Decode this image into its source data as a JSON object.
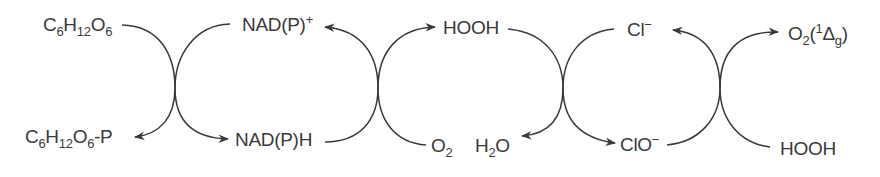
{
  "diagram": {
    "colors": {
      "stroke": "#3a3a3a",
      "text": "#3a3a3a",
      "background": "#ffffff"
    },
    "species": {
      "glucose": {
        "main": "C",
        "s1": "6",
        "m2": "H",
        "s2": "12",
        "m3": "O",
        "s3": "6"
      },
      "glucose_p": {
        "main": "C",
        "s1": "6",
        "m2": "H",
        "s2": "12",
        "m3": "O",
        "s3": "6",
        "tail": "-P"
      },
      "nadp_plus": {
        "main": "NAD(P)",
        "sup": "+"
      },
      "nadph": {
        "main": "NAD(P)H"
      },
      "hooh_top": {
        "main": "HOOH"
      },
      "o2": {
        "main": "O",
        "sub": "2"
      },
      "h2o": {
        "main": "H",
        "sub": "2",
        "tail": "O"
      },
      "cl_minus": {
        "main": "Cl",
        "sup": "−"
      },
      "clo_minus": {
        "main": "ClO",
        "sup": "−"
      },
      "singlet_o2": {
        "main": "O",
        "sub": "2",
        "open": "(",
        "sup": "1",
        "delta": "Δ",
        "dsub": "g",
        "close": ")"
      },
      "hooh_bottom": {
        "main": "HOOH"
      }
    },
    "reactions": [
      {
        "id": "r1",
        "from": "C6H12O6",
        "to": "C6H12O6-P"
      },
      {
        "id": "r1b",
        "from": "NAD(P)+",
        "to": "NAD(P)H"
      },
      {
        "id": "r2",
        "from": "NAD(P)H",
        "to": "NAD(P)+"
      },
      {
        "id": "r2b",
        "from": "O2",
        "to": "HOOH"
      },
      {
        "id": "r3",
        "from": "HOOH",
        "to": "H2O"
      },
      {
        "id": "r3b",
        "from": "Cl-",
        "to": "ClO-"
      },
      {
        "id": "r4",
        "from": "ClO-",
        "to": "Cl-"
      },
      {
        "id": "r4b",
        "from": "HOOH",
        "to": "O2(1Δg)"
      }
    ]
  }
}
